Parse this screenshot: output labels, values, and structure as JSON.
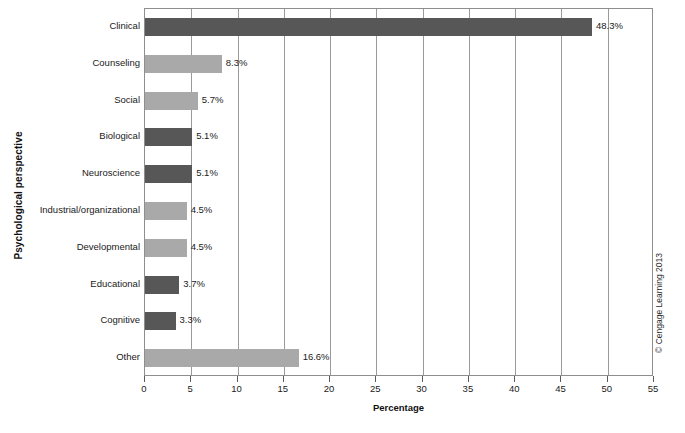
{
  "chart_data": {
    "type": "bar",
    "orientation": "horizontal",
    "title": "",
    "xlabel": "Percentage",
    "ylabel": "Psychological perspective",
    "xlim": [
      0,
      55
    ],
    "xticks": [
      0,
      5,
      10,
      15,
      20,
      25,
      30,
      35,
      40,
      45,
      50,
      55
    ],
    "gridlines": [
      5,
      10,
      15,
      20,
      25,
      30,
      35,
      40,
      45,
      50
    ],
    "grid": true,
    "legend": null,
    "categories": [
      "Clinical",
      "Counseling",
      "Social",
      "Biological",
      "Neuroscience",
      "Industrial/organizational",
      "Developmental",
      "Educational",
      "Cognitive",
      "Other"
    ],
    "values": [
      48.3,
      8.3,
      5.7,
      5.1,
      5.1,
      4.5,
      4.5,
      3.7,
      3.3,
      16.6
    ],
    "labels": [
      "48.3%",
      "8.3%",
      "5.7%",
      "5.1%",
      "5.1%",
      "4.5%",
      "4.5%",
      "3.7%",
      "3.3%",
      "16.6%"
    ],
    "bar_shades": [
      "dark",
      "light",
      "light",
      "dark",
      "dark",
      "light",
      "light",
      "dark",
      "dark",
      "light"
    ],
    "colors": {
      "dark": "#575757",
      "light": "#a9a9a9",
      "axis": "#8e8e8e",
      "grid": "#9a9a9a",
      "text": "#1a1a1a"
    }
  },
  "annotations": {
    "copyright": "© Cengage Learning 2013"
  }
}
